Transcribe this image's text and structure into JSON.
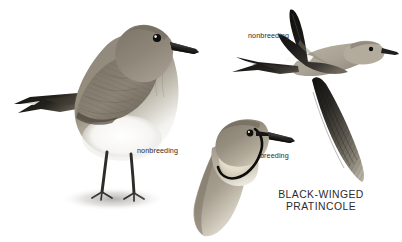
{
  "plate": {
    "background_color": "#ffffff",
    "width": 402,
    "height": 242,
    "subject": "bird-field-guide-plate"
  },
  "species": {
    "common_name": "BLACK-WINGED PRATINCOLE",
    "name_line_1": "BLACK-WINGED",
    "name_line_2": "PRATINCOLE",
    "name_block": "BLACK-WINGED\nPRATINCOLE",
    "text_color": "#2c2c2c"
  },
  "labels": {
    "standing_nonbreeding": "nonbreeding",
    "flight_nonbreeding": "nonbreeding",
    "head_breeding": "breeding",
    "text_color": "#2b2b2b"
  },
  "figures": [
    {
      "id": "standing-bird",
      "pose": "standing, left profile, facing right",
      "plumage": "nonbreeding",
      "colors": {
        "upperparts": "#8a8278",
        "breast": "#9a9287",
        "belly": "#f2f1ee",
        "tail": "#1d1c1b",
        "bill": "#262524",
        "eye": "#141414",
        "legs": "#2f2d2b",
        "shadow": "#b9b7b3"
      }
    },
    {
      "id": "flying-bird",
      "pose": "flight, left profile, facing right, forked tail",
      "plumage": "nonbreeding",
      "colors": {
        "upper_wing": "#141312",
        "body": "#aaa296",
        "underwing": "#3b3936",
        "tail": "#1b1a19",
        "eye": "#141414",
        "bill": "#262524"
      }
    },
    {
      "id": "head-portrait",
      "pose": "head and neck, left profile, facing right",
      "plumage": "breeding",
      "colors": {
        "crown": "#8d8579",
        "throat": "#e8e3d6",
        "throat_ring": "#111111",
        "eye_line": "#1a1918",
        "bill": "#272625",
        "eye": "#121212"
      }
    }
  ]
}
